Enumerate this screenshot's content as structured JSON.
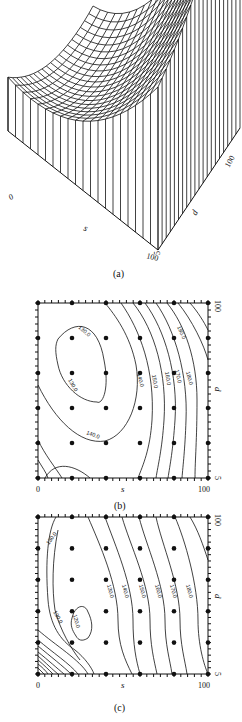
{
  "chart_data": [
    {
      "type": "surface",
      "panel": "(a)",
      "xlabel": "s",
      "ylabel": "d",
      "x_ticks": [
        "0",
        "100"
      ],
      "y_ticks": [
        "5",
        "100"
      ],
      "xlim": [
        0,
        100
      ],
      "ylim": [
        5,
        100
      ],
      "grid_lines": 20,
      "description": "3D wireframe surface, bowl-shaped with minimum near low s, mid d; rising steeply toward s=100, d=100"
    },
    {
      "type": "contour",
      "panel": "(b)",
      "xlabel": "s",
      "ylabel": "d",
      "x_ticks": [
        "0",
        "100"
      ],
      "y_ticks": [
        "5",
        "100"
      ],
      "xlim": [
        0,
        100
      ],
      "ylim": [
        5,
        100
      ],
      "contour_levels": [
        130,
        140,
        150,
        160,
        170,
        180,
        190
      ],
      "contour_labels": [
        "130.0",
        "130.0",
        "140.0",
        "140.0",
        "150.0",
        "160.0",
        "170.0",
        "180.0",
        "190.0"
      ],
      "design_points_s": [
        0,
        20,
        40,
        60,
        80,
        100
      ],
      "design_points_d": [
        5,
        24,
        43,
        62,
        81,
        100
      ]
    },
    {
      "type": "contour",
      "panel": "(c)",
      "xlabel": "s",
      "ylabel": "d",
      "x_ticks": [
        "0",
        "100"
      ],
      "y_ticks": [
        "5",
        "100"
      ],
      "xlim": [
        0,
        100
      ],
      "ylim": [
        5,
        100
      ],
      "contour_levels": [
        120,
        130,
        140,
        150,
        160,
        170,
        180
      ],
      "contour_labels": [
        "130.0",
        "130.0",
        "120.0",
        "130.0",
        "140.0",
        "150.0",
        "160.0",
        "170.0",
        "180.0"
      ],
      "design_points_s": [
        0,
        20,
        40,
        60,
        80,
        100
      ],
      "design_points_d": [
        5,
        24,
        43,
        62,
        81,
        100
      ]
    }
  ],
  "captions": {
    "a": "(a)",
    "b": "(b)",
    "c": "(c)"
  },
  "labels": {
    "s": "s",
    "d": "d",
    "x0": "0",
    "x100": "100",
    "y5": "5",
    "y100": "100"
  },
  "clabels_b": {
    "l130a": "130.0",
    "l130b": "130.0",
    "l140a": "140.0",
    "l140b": "140.0",
    "l150": "150.0",
    "l160": "160.0",
    "l170": "170.0",
    "l180": "180.0",
    "l190": "190.0"
  },
  "clabels_c": {
    "l130a": "130.0",
    "l130b": "130.0",
    "l120": "120.0",
    "l130c": "130.0",
    "l140": "140.0",
    "l150": "150.0",
    "l160": "160.0",
    "l170": "170.0",
    "l180": "180.0"
  }
}
